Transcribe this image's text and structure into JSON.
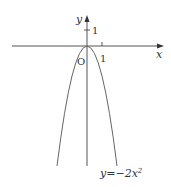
{
  "diagram": {
    "type": "function-graph",
    "axes": {
      "x_label": "x",
      "y_label": "y",
      "origin_label": "O",
      "x_tick_label": "1",
      "y_tick_label": "1"
    },
    "curve": {
      "equation_label": "y=−2x²",
      "equation_lhs": "y=−2x",
      "equation_exp": "2",
      "color": "#666666"
    }
  }
}
